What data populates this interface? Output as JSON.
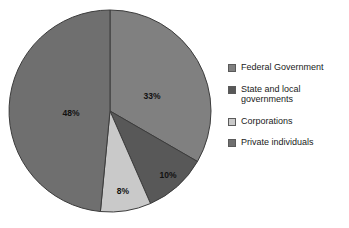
{
  "chart_data": {
    "type": "pie",
    "title": "",
    "subtitle": "",
    "xlabel": "",
    "ylabel": "",
    "grid": false,
    "legend_position": "right",
    "start_angle_deg": 0,
    "direction": "clockwise",
    "categories": [
      "Federal Government",
      "State and local governments",
      "Corporations",
      "Private individuals"
    ],
    "values": [
      33,
      10,
      8,
      48
    ],
    "data_labels": [
      "33%",
      "10%",
      "8%",
      "48%"
    ],
    "colors": [
      "#808080",
      "#585858",
      "#c9c9c9",
      "#6f6f6f"
    ],
    "slices": [
      {
        "label": "Federal Government",
        "value": 33,
        "data_label": "33%",
        "color": "#808080",
        "label_x": 144,
        "label_y": 91
      },
      {
        "label": "State and local governments",
        "value": 10,
        "data_label": "10%",
        "color": "#585858",
        "label_x": 160,
        "label_y": 170
      },
      {
        "label": "Corporations",
        "value": 8,
        "data_label": "8%",
        "color": "#c9c9c9",
        "label_x": 115,
        "label_y": 186
      },
      {
        "label": "Private individuals",
        "value": 48,
        "data_label": "48%",
        "color": "#6f6f6f",
        "label_x": 63,
        "label_y": 108
      }
    ]
  },
  "pie": {
    "center_x": 102,
    "center_y": 103,
    "radius": 101,
    "outline_color": "#3c3c3c"
  },
  "legend": {
    "items": [
      {
        "label": "Federal Government",
        "color": "#808080"
      },
      {
        "label": "State and local\ngovernments",
        "color": "#585858"
      },
      {
        "label": "Corporations",
        "color": "#c9c9c9"
      },
      {
        "label": "Private individuals",
        "color": "#6f6f6f"
      }
    ]
  }
}
